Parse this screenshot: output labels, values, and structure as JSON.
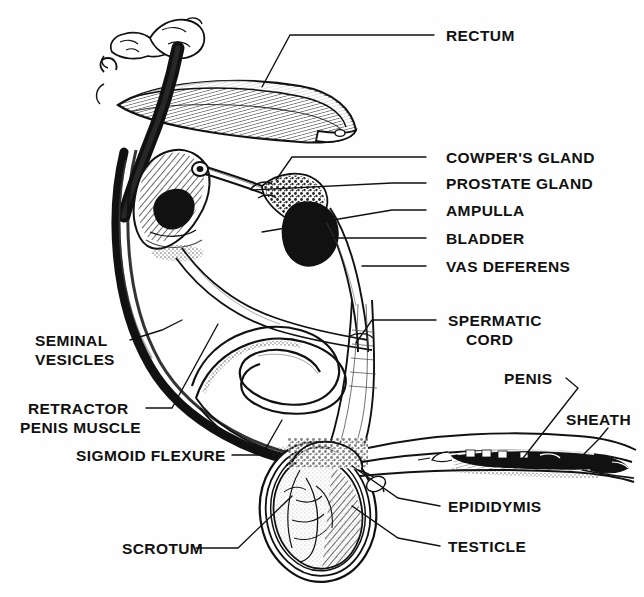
{
  "figure": {
    "type": "anatomical-line-diagram",
    "background_color": "#fefefe",
    "ink_color": "#111111",
    "label_count": 14
  },
  "labels": {
    "rectum": "RECTUM",
    "cowpers_gland": "COWPER'S GLAND",
    "prostate_gland": "PROSTATE GLAND",
    "ampulla": "AMPULLA",
    "bladder": "BLADDER",
    "vas_deferens": "VAS DEFERENS",
    "spermatic_cord_line1": "SPERMATIC",
    "spermatic_cord_line2": "CORD",
    "penis": "PENIS",
    "sheath": "SHEATH",
    "seminal_vesicles_line1": "SEMINAL",
    "seminal_vesicles_line2": "VESICLES",
    "retractor_penis_muscle_line1": "RETRACTOR",
    "retractor_penis_muscle_line2": "PENIS MUSCLE",
    "sigmoid_flexure": "SIGMOID FLEXURE",
    "scrotum": "SCROTUM",
    "epididymis": "EPIDIDYMIS",
    "testicle": "TESTICLE"
  },
  "structures": [
    {
      "name": "vertebrae",
      "description": "two lumbar vertebral bodies at upper left"
    },
    {
      "name": "rectum",
      "description": "large hatched horizontal tube across the top"
    },
    {
      "name": "bladder",
      "description": "pear-shaped organ below the rectum at left"
    },
    {
      "name": "prostate-gland",
      "description": "small dark mass at neck of bladder"
    },
    {
      "name": "cowpers-gland",
      "description": "stippled gland on pelvic urethra"
    },
    {
      "name": "ampulla",
      "description": "dark swollen terminal of the vas deferens"
    },
    {
      "name": "seminal-vesicles",
      "description": "lobulated gland mass at bladder neck"
    },
    {
      "name": "vas-deferens",
      "description": "slender duct running from scrotum to ampulla"
    },
    {
      "name": "retractor-penis-muscle",
      "description": "thick black band curving down and left"
    },
    {
      "name": "sigmoid-flexure",
      "description": "S-shaped bend of the penile body"
    },
    {
      "name": "spermatic-cord",
      "description": "vertical striated cord into the scrotum"
    },
    {
      "name": "scrotum",
      "description": "oval sac enclosing the testicle"
    },
    {
      "name": "testicle",
      "description": "textured ovoid gland inside the scrotum"
    },
    {
      "name": "epididymis",
      "description": "convoluted duct along the testicle margin"
    },
    {
      "name": "penis",
      "description": "elongated shaft extending to lower right"
    },
    {
      "name": "sheath",
      "description": "prepuce enclosing the free end of the penis"
    }
  ]
}
